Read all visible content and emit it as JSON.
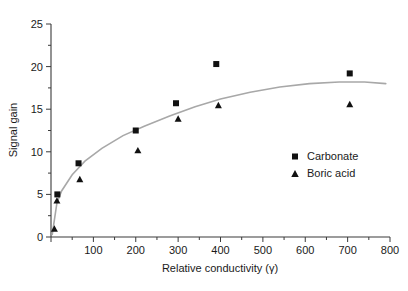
{
  "chart_data": {
    "type": "scatter",
    "title": "",
    "xlabel": "Relative conductivity (γ)",
    "ylabel": "Signal gain",
    "xlim": [
      0,
      800
    ],
    "ylim": [
      0,
      25
    ],
    "xticks": [
      0,
      100,
      200,
      300,
      400,
      500,
      600,
      700,
      800
    ],
    "xtick_labels": [
      "",
      "100",
      "200",
      "300",
      "400",
      "500",
      "600",
      "700",
      "800"
    ],
    "yticks": [
      0,
      5,
      10,
      15,
      20,
      25
    ],
    "ytick_labels": [
      "0",
      "5",
      "10",
      "15",
      "20",
      "25"
    ],
    "minor_tick_interval_x": 50,
    "minor_tick_interval_y": 2.5,
    "grid": false,
    "legend_position": "center-right",
    "series": [
      {
        "name": "Carbonate",
        "marker": "square",
        "color": "#111111",
        "points": [
          {
            "x": 15,
            "y": 5.0
          },
          {
            "x": 65,
            "y": 8.65
          },
          {
            "x": 200,
            "y": 12.5
          },
          {
            "x": 295,
            "y": 15.7
          },
          {
            "x": 390,
            "y": 20.3
          },
          {
            "x": 705,
            "y": 19.2
          }
        ]
      },
      {
        "name": "Boric acid",
        "marker": "triangle",
        "color": "#111111",
        "points": [
          {
            "x": 8,
            "y": 1.0
          },
          {
            "x": 14,
            "y": 4.3
          },
          {
            "x": 68,
            "y": 6.8
          },
          {
            "x": 205,
            "y": 10.2
          },
          {
            "x": 300,
            "y": 13.9
          },
          {
            "x": 395,
            "y": 15.5
          },
          {
            "x": 705,
            "y": 15.6
          }
        ]
      }
    ],
    "fit_curve": {
      "name": "saturation-fit",
      "color": "#a8a8a8",
      "points": [
        {
          "x": 3,
          "y": 0.3
        },
        {
          "x": 8,
          "y": 2.0
        },
        {
          "x": 14,
          "y": 4.0
        },
        {
          "x": 25,
          "y": 5.4
        },
        {
          "x": 50,
          "y": 7.3
        },
        {
          "x": 80,
          "y": 8.9
        },
        {
          "x": 120,
          "y": 10.4
        },
        {
          "x": 170,
          "y": 11.9
        },
        {
          "x": 220,
          "y": 13.0
        },
        {
          "x": 280,
          "y": 14.2
        },
        {
          "x": 340,
          "y": 15.3
        },
        {
          "x": 400,
          "y": 16.2
        },
        {
          "x": 470,
          "y": 17.0
        },
        {
          "x": 540,
          "y": 17.6
        },
        {
          "x": 610,
          "y": 18.0
        },
        {
          "x": 680,
          "y": 18.2
        },
        {
          "x": 740,
          "y": 18.2
        },
        {
          "x": 790,
          "y": 18.0
        }
      ]
    },
    "legend": [
      {
        "label": "Carbonate",
        "marker": "square"
      },
      {
        "label": "Boric acid",
        "marker": "triangle"
      }
    ]
  },
  "axes": {
    "x_title": "Relative conductivity (γ)",
    "y_title": "Signal gain"
  }
}
